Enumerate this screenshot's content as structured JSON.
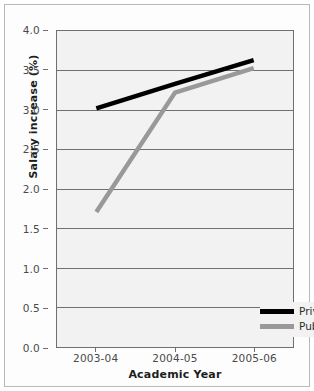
{
  "chart_data": {
    "type": "line",
    "title": "",
    "xlabel": "Academic Year",
    "ylabel": "Salary increase (%)",
    "categories": [
      "2003-04",
      "2004-05",
      "2005-06"
    ],
    "ylim": [
      0.0,
      4.0
    ],
    "ytick_labels": [
      "4.0",
      "3.5",
      "3.0",
      "2.5",
      "2.0",
      "1.5",
      "1.0",
      "0.5",
      "0.0"
    ],
    "ytick_values": [
      4.0,
      3.5,
      3.0,
      2.5,
      2.0,
      1.5,
      1.0,
      0.5,
      0.0
    ],
    "grid": true,
    "grid_axis": "y",
    "legend_position": "lower-right",
    "series": [
      {
        "name": "Private",
        "color": "#000000",
        "values": [
          3.02,
          3.33,
          3.63
        ]
      },
      {
        "name": "Public",
        "color": "#999999",
        "values": [
          1.71,
          3.22,
          3.53
        ]
      }
    ]
  },
  "colors": {
    "plot_background": "#f2f2f2",
    "grid_line": "#6f6f6f",
    "axis_line": "#6f6f6f",
    "private_series": "#000000",
    "public_series": "#999999",
    "tick_label": "#4a4a4a",
    "axis_title": "#1d1d1d"
  }
}
